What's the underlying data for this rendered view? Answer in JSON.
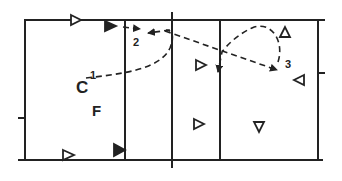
{
  "diagram": {
    "type": "volleyball-court-play",
    "colors": {
      "line": "#222222",
      "background": "#ffffff"
    },
    "court": {
      "left": 25,
      "right": 318,
      "top": 20,
      "bottom": 160,
      "vertical_lines": [
        125,
        172,
        220
      ]
    },
    "labels": {
      "C": "C",
      "F": "F",
      "step1": "1",
      "step2": "2",
      "step3": "3"
    },
    "players": [
      {
        "id": "p1",
        "x": 75,
        "y": 20,
        "dir": "right",
        "filled": false
      },
      {
        "id": "p2",
        "x": 111,
        "y": 26,
        "dir": "right",
        "filled": true
      },
      {
        "id": "p3",
        "x": 67,
        "y": 155,
        "dir": "right",
        "filled": false
      },
      {
        "id": "p4",
        "x": 118,
        "y": 150,
        "dir": "right",
        "filled": true
      },
      {
        "id": "p5",
        "x": 200,
        "y": 65,
        "dir": "right",
        "filled": false
      },
      {
        "id": "p6",
        "x": 199,
        "y": 124,
        "dir": "right",
        "filled": false
      },
      {
        "id": "p7",
        "x": 285,
        "y": 32,
        "dir": "up",
        "filled": false
      },
      {
        "id": "p8",
        "x": 299,
        "y": 80,
        "dir": "left",
        "filled": false
      },
      {
        "id": "p9",
        "x": 259,
        "y": 127,
        "dir": "down",
        "filled": false
      }
    ]
  }
}
